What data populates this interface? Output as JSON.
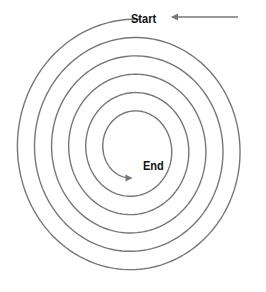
{
  "diagram": {
    "type": "spiral",
    "start_label": "Start",
    "end_label": "End",
    "line_color": "#777777",
    "text_color": "#111111",
    "turns": 5.5,
    "direction": "counterclockwise-inward"
  }
}
